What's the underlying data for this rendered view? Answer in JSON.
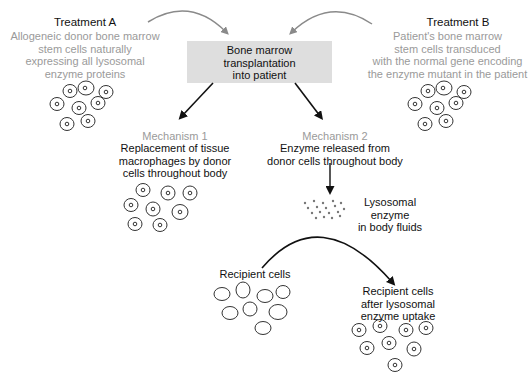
{
  "treatment_a": {
    "title": "Treatment A",
    "lines": [
      "Allogeneic donor bone marrow",
      "stem cells naturally",
      "expressing all lysosomal",
      "enzyme proteins"
    ]
  },
  "treatment_b": {
    "title": "Treatment B",
    "lines": [
      "Patient's bone marrow",
      "stem cells transduced",
      "with the normal gene encoding",
      "the enzyme mutant in the patient"
    ]
  },
  "center_box": {
    "lines": [
      "Bone marrow",
      "transplantation",
      "into patient"
    ]
  },
  "mechanism_1": {
    "title": "Mechanism 1",
    "lines": [
      "Replacement of tissue",
      "macrophages by donor",
      "cells throughout body"
    ]
  },
  "mechanism_2": {
    "title": "Mechanism 2",
    "lines": [
      "Enzyme released from",
      "donor cells throughout body"
    ]
  },
  "enzyme_label": {
    "lines": [
      "Lysosomal",
      "enzyme",
      "in body fluids"
    ]
  },
  "recipient_cells": {
    "label": "Recipient cells"
  },
  "recipient_after": {
    "lines": [
      "Recipient cells",
      "after lysosomal",
      "enzyme uptake"
    ]
  },
  "colors": {
    "arrow_gray": "#8a8a8a",
    "arrow_black": "#111111",
    "box_fill": "#dedede",
    "subtext_gray": "#9a9a9a"
  }
}
